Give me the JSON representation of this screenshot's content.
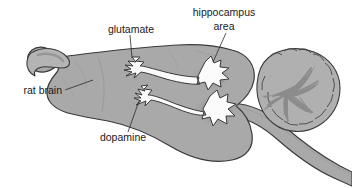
{
  "figure": {
    "background_color": "#ffffff",
    "width": 352,
    "height": 188
  },
  "colors": {
    "brain_fill": "#a9a9a9",
    "brain_fill_light": "#b8b8b8",
    "cerebellum_fill": "#b0b0b0",
    "arbor_fill": "#8c8c8c",
    "neuron_fill": "#fbfbfb",
    "outline": "#3a3a3a",
    "shadow": "#8f8f8f",
    "label_text": "#1a1a1a",
    "leader_line": "#2b2b2b"
  },
  "labels": [
    {
      "id": "rat-brain",
      "text": "rat brain",
      "x": 62,
      "y": 91,
      "align": "end"
    },
    {
      "id": "glutamate",
      "text": "glutamate",
      "x": 131,
      "y": 30,
      "align": "middle"
    },
    {
      "id": "hippocampus",
      "text": "hippocampus",
      "x": 224,
      "y": 13,
      "align": "middle"
    },
    {
      "id": "hippocampus-area",
      "text": "area",
      "x": 224,
      "y": 27,
      "align": "middle"
    },
    {
      "id": "dopamine",
      "text": "dopamine",
      "x": 123,
      "y": 138,
      "align": "middle"
    }
  ],
  "structures": [
    {
      "id": "olfactory-bulb",
      "name": "olfactory bulb"
    },
    {
      "id": "cerebral-cortex",
      "name": "cerebral cortex"
    },
    {
      "id": "cerebellum",
      "name": "cerebellum"
    },
    {
      "id": "arbor-vitae",
      "name": "arbor vitae branching"
    },
    {
      "id": "brainstem",
      "name": "brainstem / spinal cord"
    },
    {
      "id": "neuron-glutamate",
      "name": "glutamate neuron"
    },
    {
      "id": "neuron-dopamine",
      "name": "dopamine neuron"
    },
    {
      "id": "hippocampus-region",
      "name": "hippocampus area"
    }
  ]
}
